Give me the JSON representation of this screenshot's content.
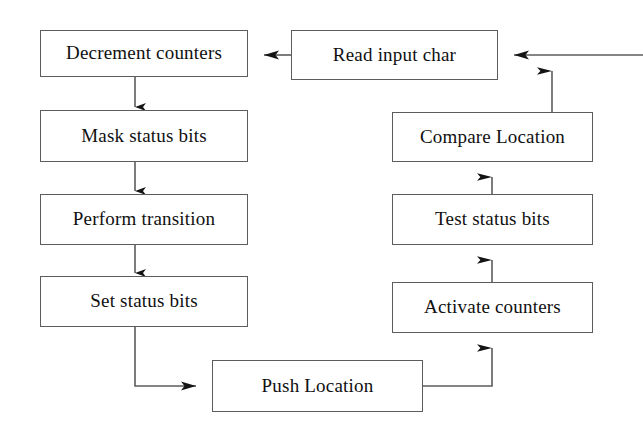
{
  "diagram": {
    "background_color": "#ffffff",
    "line_color": "#5c5c5c",
    "arrow_color": "#141414",
    "text_color": "#101010",
    "nodes": [
      {
        "id": "decrement-counters",
        "label": "Decrement counters",
        "x": 40,
        "y": 30,
        "w": 208,
        "h": 47
      },
      {
        "id": "mask-status-bits",
        "label": "Mask status bits",
        "x": 40,
        "y": 110,
        "w": 208,
        "h": 52
      },
      {
        "id": "perform-transition",
        "label": "Perform transition",
        "x": 40,
        "y": 194,
        "w": 208,
        "h": 51
      },
      {
        "id": "set-status-bits",
        "label": "Set status bits",
        "x": 40,
        "y": 276,
        "w": 208,
        "h": 51
      },
      {
        "id": "push-location",
        "label": "Push Location",
        "x": 212,
        "y": 360,
        "w": 211,
        "h": 52
      },
      {
        "id": "activate-counters",
        "label": "Activate counters",
        "x": 392,
        "y": 282,
        "w": 201,
        "h": 51
      },
      {
        "id": "test-status-bits",
        "label": "Test status bits",
        "x": 392,
        "y": 194,
        "w": 201,
        "h": 51
      },
      {
        "id": "compare-location",
        "label": "Compare Location",
        "x": 392,
        "y": 112,
        "w": 201,
        "h": 50
      },
      {
        "id": "read-input-char",
        "label": "Read input char",
        "x": 291,
        "y": 30,
        "w": 207,
        "h": 50
      }
    ],
    "edges": [
      {
        "id": "edge-read-to-decrement",
        "from": "read-input-char",
        "to": "decrement-counters"
      },
      {
        "id": "edge-decrement-to-mask",
        "from": "decrement-counters",
        "to": "mask-status-bits"
      },
      {
        "id": "edge-mask-to-perform",
        "from": "mask-status-bits",
        "to": "perform-transition"
      },
      {
        "id": "edge-perform-to-set",
        "from": "perform-transition",
        "to": "set-status-bits"
      },
      {
        "id": "edge-set-to-push",
        "from": "set-status-bits",
        "to": "push-location"
      },
      {
        "id": "edge-push-to-activate",
        "from": "push-location",
        "to": "activate-counters"
      },
      {
        "id": "edge-activate-to-test",
        "from": "activate-counters",
        "to": "test-status-bits"
      },
      {
        "id": "edge-test-to-compare",
        "from": "test-status-bits",
        "to": "compare-location"
      },
      {
        "id": "edge-compare-to-loopback",
        "from": "compare-location",
        "to": "read-input-char"
      },
      {
        "id": "edge-external-input",
        "from": "right-edge",
        "to": "read-input-char"
      }
    ]
  }
}
